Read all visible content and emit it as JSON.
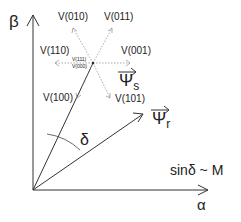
{
  "axes": {
    "beta_label": "β",
    "alpha_label": "α"
  },
  "vectors": {
    "psi_s": "Ψ",
    "psi_s_sub": "s",
    "psi_r": "Ψ",
    "psi_r_sub": "r"
  },
  "voltage_vectors": {
    "v010": "V(010)",
    "v011": "V(011)",
    "v110": "V(110)",
    "v001": "V(001)",
    "v100": "V(100)",
    "v101": "V(101)",
    "v111": "V(111)",
    "v000": "V(000)"
  },
  "angle_label": "δ",
  "relation": "sinδ ~ M",
  "colors": {
    "line": "#333333",
    "dotted": "#777777"
  }
}
